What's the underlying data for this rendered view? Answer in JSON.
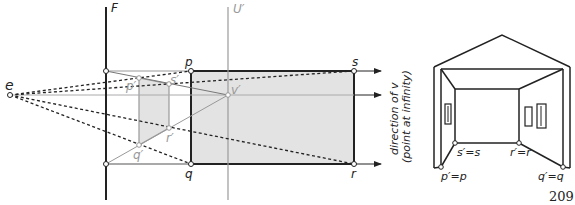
{
  "left_figure": {
    "labels": {
      "F": "F",
      "U": "U′",
      "e": "e",
      "p": "p",
      "q": "q",
      "s": "s",
      "r": "r",
      "p_prime": "p′",
      "q_prime": "q′",
      "s_prime": "s′",
      "r_prime": "r′",
      "v_prime": "v′"
    },
    "direction_text_line1": "direction of v",
    "direction_text_line2": "(point at infinity)"
  },
  "right_figure": {
    "labels": {
      "p": "p′=p",
      "q": "q′=q",
      "s": "s′=s",
      "r": "r′=r"
    }
  },
  "page_number": "209",
  "colors": {
    "shade": "#e3e3e3",
    "gray_line": "#9a9a9a",
    "black_line": "#222222"
  }
}
